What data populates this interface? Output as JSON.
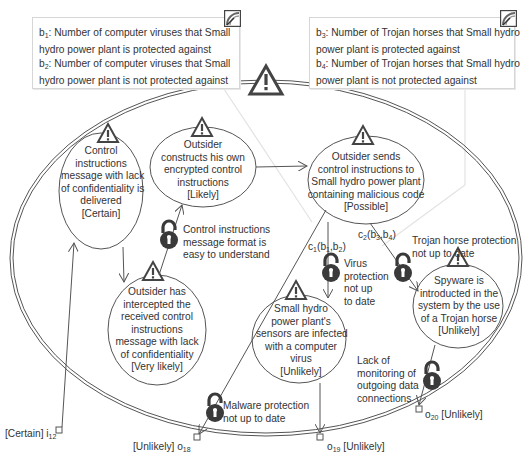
{
  "notes": [
    {
      "id": "note-viruses",
      "lines": [
        {
          "var": "b",
          "sub": "1",
          "text": ": Number of computer viruses that Small"
        },
        {
          "text": "hydro power plant is protected against"
        },
        {
          "var": "b",
          "sub": "2",
          "text": ": Number of computer viruses that Small"
        },
        {
          "text": "hydro power plant is not protected against"
        }
      ]
    },
    {
      "id": "note-trojans",
      "lines": [
        {
          "var": "b",
          "sub": "3",
          "text": ": Number of Trojan horses that Small hydro"
        },
        {
          "text": "power plant is protected against"
        },
        {
          "var": "b",
          "sub": "4",
          "text": ": Number of Trojan horses that Small hydro"
        },
        {
          "text": "power plant is not protected against"
        }
      ]
    }
  ],
  "threat_scenarios": [
    {
      "id": "control-instructions-delivered",
      "lines": [
        "Control",
        "instructions",
        "message with lack",
        "of confidentiality is",
        "delivered",
        "[Certain]"
      ],
      "likelihood": "Certain"
    },
    {
      "id": "outsider-constructs",
      "lines": [
        "Outsider",
        "constructs his own",
        "encrypted control",
        "instructions",
        "[Likely]"
      ],
      "likelihood": "Likely"
    },
    {
      "id": "outsider-sends",
      "lines": [
        "Outsider sends",
        "control instructions to",
        "Small hydro power plant",
        "containing malicious code",
        "[Possible]"
      ],
      "likelihood": "Possible"
    },
    {
      "id": "outsider-intercepted",
      "lines": [
        "Outsider has",
        "intercepted the",
        "received control",
        "instructions",
        "message with lack",
        "of confidentiality",
        "[Very likely]"
      ],
      "likelihood": "Very likely"
    },
    {
      "id": "sensors-infected",
      "lines": [
        "Small hydro",
        "power plant's",
        "sensors are infected",
        "with a computer",
        "virus",
        "[Unlikely]"
      ],
      "likelihood": "Unlikely"
    },
    {
      "id": "spyware-introduced",
      "lines": [
        "Spyware is",
        "introducted in the",
        "system by the use",
        "of a Trojan horse",
        "[Unlikely]"
      ],
      "likelihood": "Unlikely"
    }
  ],
  "vulnerabilities": [
    {
      "id": "format-easy",
      "lines": [
        "Control instructions",
        "message format is",
        "easy to understand"
      ]
    },
    {
      "id": "virus-protection",
      "lines": [
        "Virus",
        "protection",
        "not up",
        "to date"
      ]
    },
    {
      "id": "trojan-protection",
      "lines": [
        "Trojan horse protection",
        "not up to date"
      ]
    },
    {
      "id": "malware-protection",
      "lines": [
        "Malware protection",
        "not up to date"
      ]
    },
    {
      "id": "monitoring",
      "lines": [
        "Lack of",
        "monitoring of",
        "outgoing data",
        "connections"
      ]
    }
  ],
  "conditional_labels": {
    "c1": {
      "name": "c",
      "sub": "1",
      "args": "(b",
      "a1": "1",
      "mid": ",b",
      "a2": "2",
      "end": ")"
    },
    "c2": {
      "name": "c",
      "sub": "2",
      "args": "(b",
      "a1": "3",
      "mid": ",b",
      "a2": "4",
      "end": ")"
    }
  },
  "gates": {
    "i12": {
      "prefix": "[Certain] ",
      "name": "i",
      "sub": "12",
      "suffix": ""
    },
    "o18": {
      "prefix": "[Unlikely] ",
      "name": "o",
      "sub": "18",
      "suffix": ""
    },
    "o19": {
      "prefix": "",
      "name": "o",
      "sub": "19",
      "suffix": " [Unlikely]"
    },
    "o20": {
      "prefix": "",
      "name": "o",
      "sub": "20",
      "suffix": " [Unlikely]"
    }
  },
  "colors": {
    "line": "#555555",
    "lock": "#3a3a3a",
    "note_border": "#d6d6d6",
    "faint_connector": "#dddddd"
  }
}
